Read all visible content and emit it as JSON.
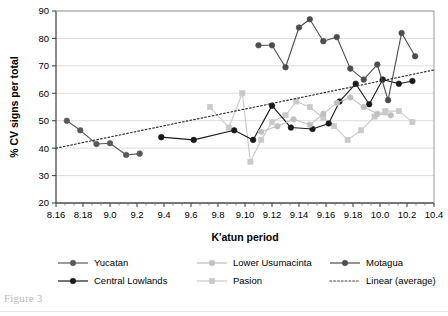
{
  "figure": {
    "caption": "Figure 3"
  },
  "chart_data": {
    "type": "line",
    "title": "",
    "xlabel": "K'atun period",
    "ylabel": "% CV signs per total",
    "ylim": [
      20,
      90
    ],
    "ytick_step": 10,
    "yticks": [
      20,
      30,
      40,
      50,
      60,
      70,
      80,
      90
    ],
    "grid": true,
    "grid_axis": "y",
    "legend_position": "bottom",
    "categories": [
      "8.16",
      "8.18",
      "9.0",
      "9.2",
      "9.4",
      "9.6",
      "9.8",
      "9.10",
      "9.12",
      "9.14",
      "9.16",
      "9.18",
      "10.0",
      "10.2",
      "10.4"
    ],
    "x_tick_labels": [
      "8.16",
      "8.18",
      "9.0",
      "9.2",
      "9.4",
      "9.6",
      "9.8",
      "9.10",
      "9.12",
      "9.14",
      "9.16",
      "9.18",
      "10.0",
      "10.2",
      "10.4"
    ],
    "x_index_range": [
      0,
      14
    ],
    "x_minor_ticks_per_interval": 2,
    "series": [
      {
        "name": "Yucatan",
        "color": "#595959",
        "marker": "circle",
        "points": [
          {
            "x": 0.4,
            "y": 50.0
          },
          {
            "x": 0.9,
            "y": 46.5
          },
          {
            "x": 1.5,
            "y": 41.5
          },
          {
            "x": 2.0,
            "y": 41.8
          },
          {
            "x": 2.6,
            "y": 37.5
          },
          {
            "x": 3.1,
            "y": 38.0
          }
        ]
      },
      {
        "name": "Pasion",
        "color": "#c9c9c9",
        "marker": "square",
        "points": [
          {
            "x": 5.7,
            "y": 55.0
          },
          {
            "x": 6.4,
            "y": 47.5
          },
          {
            "x": 6.9,
            "y": 60.0
          },
          {
            "x": 7.2,
            "y": 35.0
          },
          {
            "x": 7.6,
            "y": 43.0
          },
          {
            "x": 8.0,
            "y": 49.5
          },
          {
            "x": 8.5,
            "y": 52.0
          },
          {
            "x": 8.9,
            "y": 57.0
          },
          {
            "x": 9.4,
            "y": 55.0
          },
          {
            "x": 9.9,
            "y": 51.0
          },
          {
            "x": 10.3,
            "y": 48.0
          },
          {
            "x": 10.8,
            "y": 43.0
          },
          {
            "x": 11.3,
            "y": 46.5
          },
          {
            "x": 11.8,
            "y": 51.5
          },
          {
            "x": 12.2,
            "y": 53.5
          },
          {
            "x": 12.7,
            "y": 53.5
          },
          {
            "x": 13.2,
            "y": 49.5
          }
        ]
      },
      {
        "name": "Central Lowlands",
        "color": "#1a1a1a",
        "marker": "circle",
        "points": [
          {
            "x": 3.9,
            "y": 44.0
          },
          {
            "x": 5.1,
            "y": 43.0
          },
          {
            "x": 6.6,
            "y": 46.5
          },
          {
            "x": 7.3,
            "y": 43.0
          },
          {
            "x": 8.0,
            "y": 55.5
          },
          {
            "x": 8.7,
            "y": 47.5
          },
          {
            "x": 9.5,
            "y": 47.0
          },
          {
            "x": 10.1,
            "y": 49.0
          },
          {
            "x": 10.5,
            "y": 57.0
          },
          {
            "x": 11.1,
            "y": 63.5
          },
          {
            "x": 11.6,
            "y": 56.0
          },
          {
            "x": 12.1,
            "y": 65.0
          },
          {
            "x": 12.7,
            "y": 63.5
          },
          {
            "x": 13.2,
            "y": 64.5
          }
        ]
      },
      {
        "name": "Lower Usumacinta",
        "color": "#bfbfbf",
        "marker": "circle",
        "points": [
          {
            "x": 7.6,
            "y": 46.0
          },
          {
            "x": 8.2,
            "y": 48.0
          },
          {
            "x": 8.8,
            "y": 50.5
          },
          {
            "x": 9.4,
            "y": 48.5
          },
          {
            "x": 9.9,
            "y": 52.5
          },
          {
            "x": 10.4,
            "y": 56.5
          },
          {
            "x": 10.9,
            "y": 58.5
          },
          {
            "x": 11.4,
            "y": 55.0
          },
          {
            "x": 11.9,
            "y": 52.5
          },
          {
            "x": 12.4,
            "y": 52.0
          }
        ]
      },
      {
        "name": "Motagua",
        "color": "#4d4d4d",
        "marker": "circle",
        "points": [
          {
            "x": 7.5,
            "y": 77.5
          },
          {
            "x": 8.0,
            "y": 77.5
          },
          {
            "x": 8.5,
            "y": 69.5
          },
          {
            "x": 9.0,
            "y": 84.0
          },
          {
            "x": 9.4,
            "y": 87.0
          },
          {
            "x": 9.9,
            "y": 79.0
          },
          {
            "x": 10.4,
            "y": 80.5
          },
          {
            "x": 10.9,
            "y": 69.0
          },
          {
            "x": 11.4,
            "y": 65.0
          },
          {
            "x": 11.9,
            "y": 70.5
          },
          {
            "x": 12.3,
            "y": 57.5
          },
          {
            "x": 12.8,
            "y": 82.0
          },
          {
            "x": 13.3,
            "y": 73.5
          }
        ]
      }
    ],
    "trendline": {
      "name": "Linear (average)",
      "color": "#333333",
      "style": "dotted",
      "x0": 0.0,
      "y0": 40.0,
      "x1": 14.0,
      "y1": 68.5
    },
    "legend": [
      {
        "label": "Yucatan",
        "color": "#595959",
        "marker": "circle",
        "style": "solid"
      },
      {
        "label": "Central Lowlands",
        "color": "#1a1a1a",
        "marker": "circle",
        "style": "solid"
      },
      {
        "label": "Lower Usumacinta",
        "color": "#bfbfbf",
        "marker": "circle",
        "style": "solid"
      },
      {
        "label": "Pasion",
        "color": "#c9c9c9",
        "marker": "square",
        "style": "solid"
      },
      {
        "label": "Motagua",
        "color": "#4d4d4d",
        "marker": "circle",
        "style": "solid"
      },
      {
        "label": "Linear (average)",
        "color": "#333333",
        "marker": "none",
        "style": "dotted"
      }
    ]
  }
}
